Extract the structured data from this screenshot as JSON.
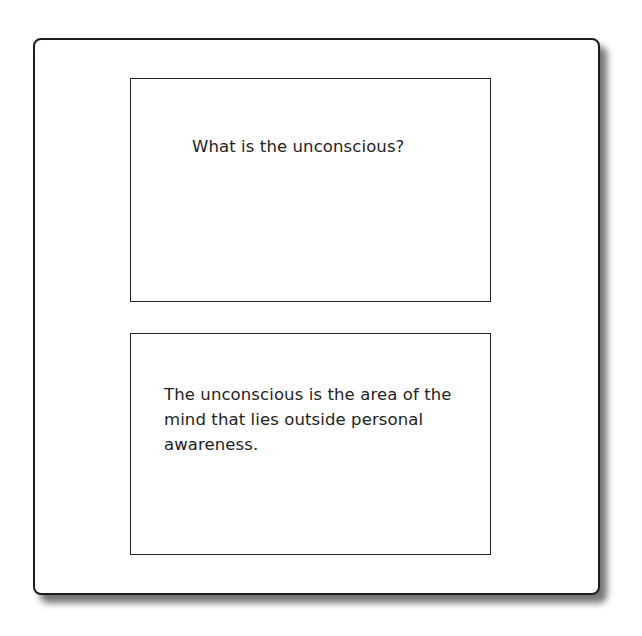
{
  "flashcard": {
    "front": {
      "label": "Question",
      "text": "What is the unconscious?"
    },
    "back": {
      "label": "Answer",
      "text": "The unconscious is the area of the mind that lies outside personal awareness."
    }
  },
  "colors": {
    "border": "#1a1a1a",
    "background": "#ffffff",
    "text": "#222222"
  }
}
